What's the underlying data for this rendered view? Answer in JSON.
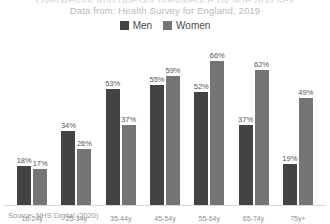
{
  "header": {
    "title_clipped": "Overweight and obesity prevalence by age and sex",
    "subtitle": "Data from: Health Survey for England, 2019"
  },
  "legend": {
    "items": [
      {
        "label": "Men",
        "color": "#434343"
      },
      {
        "label": "Women",
        "color": "#757575"
      }
    ]
  },
  "footer": {
    "source": "Source: NHS Digital (2020)"
  },
  "chart_data": {
    "type": "bar",
    "title": "Overweight and obesity prevalence by age and sex",
    "subtitle": "Data from: Health Survey for England, 2019",
    "xlabel": "",
    "ylabel": "",
    "ylim": [
      0,
      70
    ],
    "grid": false,
    "legend_position": "top",
    "value_labels": true,
    "value_suffix": "%",
    "categories": [
      "16-24y",
      "25-34y",
      "35-44y",
      "45-54y",
      "55-64y",
      "65-74y",
      "75y+"
    ],
    "series": [
      {
        "name": "Men",
        "color": "#434343",
        "values": [
          18,
          34,
          53,
          55,
          52,
          37,
          19
        ]
      },
      {
        "name": "Women",
        "color": "#757575",
        "values": [
          17,
          26,
          37,
          59,
          66,
          62,
          49
        ]
      }
    ],
    "source": "Source: NHS Digital (2020)"
  }
}
